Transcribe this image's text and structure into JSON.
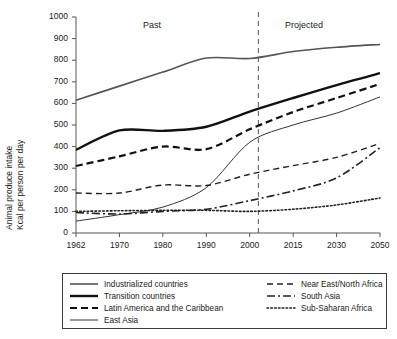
{
  "chart_data": {
    "type": "line",
    "title": "",
    "xlabel": "",
    "ylabel": "Animal produce intake Kcal per person per day",
    "ylabel_line1": "Animal produce intake",
    "ylabel_line2": "Kcal per person per day",
    "categories": [
      "1962",
      "1970",
      "1980",
      "1990",
      "2000",
      "2015",
      "2030",
      "2050"
    ],
    "x": [
      1962,
      1970,
      1980,
      1990,
      2000,
      2015,
      2030,
      2050
    ],
    "ylim": [
      0,
      1000
    ],
    "yticks": [
      "0",
      "100",
      "200",
      "300",
      "400",
      "500",
      "600",
      "700",
      "800",
      "900",
      "1000"
    ],
    "ytick_values": [
      0,
      100,
      200,
      300,
      400,
      500,
      600,
      700,
      800,
      900,
      1000
    ],
    "grid": false,
    "legend_position": "below",
    "annotations": [
      {
        "text": "Past",
        "x_category": "1980"
      },
      {
        "text": "Projected",
        "x_category": "2030"
      },
      {
        "text": "divider",
        "x_value": 2003,
        "style": "dashed-vertical"
      }
    ],
    "divider_year": 2003,
    "series": [
      {
        "name": "Industrialized countries",
        "style": "solid",
        "width": 1.6,
        "color": "#555555",
        "values": [
          615,
          680,
          745,
          810,
          808,
          840,
          860,
          873
        ]
      },
      {
        "name": "Transition countries",
        "style": "solid",
        "width": 2.4,
        "color": "#111111",
        "values": [
          385,
          475,
          473,
          492,
          562,
          625,
          685,
          740
        ]
      },
      {
        "name": "Latin America and the Caribbean",
        "style": "dashed",
        "width": 2.2,
        "color": "#111111",
        "values": [
          310,
          355,
          400,
          388,
          480,
          560,
          625,
          690
        ]
      },
      {
        "name": "East Asia",
        "style": "solid",
        "width": 1.0,
        "color": "#333333",
        "values": [
          55,
          85,
          120,
          210,
          420,
          500,
          555,
          630
        ]
      },
      {
        "name": "Near East/North Africa",
        "style": "dashed",
        "width": 1.4,
        "color": "#222222",
        "values": [
          185,
          185,
          222,
          220,
          272,
          312,
          350,
          415
        ]
      },
      {
        "name": "South Asia",
        "style": "dashdot",
        "width": 1.6,
        "color": "#222222",
        "values": [
          95,
          88,
          100,
          110,
          150,
          195,
          255,
          395
        ]
      },
      {
        "name": "Sub-Saharan Africa",
        "style": "dotted",
        "width": 1.6,
        "color": "#222222",
        "values": [
          100,
          103,
          105,
          105,
          100,
          110,
          130,
          162
        ]
      }
    ],
    "legend": {
      "left_column": [
        "Industrialized countries",
        "Transition countries",
        "Latin America and the Caribbean",
        "East Asia"
      ],
      "right_column": [
        "Near East/North Africa",
        "South Asia",
        "Sub-Saharan Africa"
      ]
    }
  }
}
